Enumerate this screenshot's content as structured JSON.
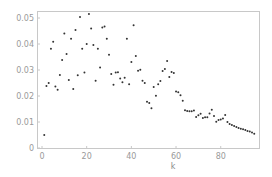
{
  "chart_data": {
    "type": "scatter",
    "title": "",
    "xlabel": "k",
    "ylabel": "",
    "xlim": [
      -2,
      98
    ],
    "ylim": [
      -0.0003,
      0.053
    ],
    "x_ticks": [
      0,
      20,
      40,
      60,
      80
    ],
    "y_ticks": [
      0,
      0.01,
      0.02,
      0.03,
      0.04,
      0.05
    ],
    "x_tick_labels": [
      "0",
      "20",
      "40",
      "60",
      "80"
    ],
    "y_tick_labels": [
      "0",
      "0.01",
      "0.02",
      "0.03",
      "0.04",
      "0.05"
    ],
    "grid": false,
    "frame": true,
    "marker_color": "#333333",
    "frame_color": "#c8c8c8",
    "series": [
      {
        "name": "data",
        "points": [
          [
            1,
            0.005
          ],
          [
            2,
            0.0238
          ],
          [
            3,
            0.025
          ],
          [
            4,
            0.0382
          ],
          [
            5,
            0.0409
          ],
          [
            6,
            0.0237
          ],
          [
            7,
            0.0224
          ],
          [
            8,
            0.0281
          ],
          [
            9,
            0.0338
          ],
          [
            10,
            0.044
          ],
          [
            11,
            0.0362
          ],
          [
            12,
            0.0262
          ],
          [
            13,
            0.042
          ],
          [
            14,
            0.0227
          ],
          [
            15,
            0.0454
          ],
          [
            16,
            0.028
          ],
          [
            17,
            0.0504
          ],
          [
            18,
            0.0382
          ],
          [
            19,
            0.029
          ],
          [
            20,
            0.04
          ],
          [
            21,
            0.0515
          ],
          [
            22,
            0.046
          ],
          [
            23,
            0.0396
          ],
          [
            24,
            0.0259
          ],
          [
            25,
            0.0382
          ],
          [
            26,
            0.031
          ],
          [
            27,
            0.0463
          ],
          [
            28,
            0.0467
          ],
          [
            29,
            0.042
          ],
          [
            30,
            0.0359
          ],
          [
            31,
            0.0285
          ],
          [
            32,
            0.0243
          ],
          [
            33,
            0.029
          ],
          [
            34,
            0.0291
          ],
          [
            35,
            0.0267
          ],
          [
            36,
            0.0253
          ],
          [
            37,
            0.027
          ],
          [
            38,
            0.042
          ],
          [
            39,
            0.0245
          ],
          [
            40,
            0.0331
          ],
          [
            41,
            0.0472
          ],
          [
            42,
            0.0354
          ],
          [
            43,
            0.0297
          ],
          [
            44,
            0.0301
          ],
          [
            45,
            0.0259
          ],
          [
            46,
            0.025
          ],
          [
            47,
            0.0178
          ],
          [
            48,
            0.0173
          ],
          [
            49,
            0.0153
          ],
          [
            50,
            0.0235
          ],
          [
            51,
            0.0201
          ],
          [
            52,
            0.0245
          ],
          [
            53,
            0.0258
          ],
          [
            54,
            0.0296
          ],
          [
            55,
            0.0304
          ],
          [
            56,
            0.0335
          ],
          [
            57,
            0.0273
          ],
          [
            58,
            0.0292
          ],
          [
            59,
            0.0288
          ],
          [
            60,
            0.0217
          ],
          [
            61,
            0.0214
          ],
          [
            62,
            0.0203
          ],
          [
            63,
            0.0182
          ],
          [
            64,
            0.0145
          ],
          [
            65,
            0.0142
          ],
          [
            66,
            0.0141
          ],
          [
            67,
            0.0141
          ],
          [
            68,
            0.0144
          ],
          [
            69,
            0.0119
          ],
          [
            70,
            0.0126
          ],
          [
            71,
            0.0132
          ],
          [
            72,
            0.0115
          ],
          [
            73,
            0.0118
          ],
          [
            74,
            0.0118
          ],
          [
            75,
            0.0133
          ],
          [
            76,
            0.0147
          ],
          [
            77,
            0.0123
          ],
          [
            78,
            0.0101
          ],
          [
            79,
            0.0108
          ],
          [
            80,
            0.011
          ],
          [
            81,
            0.0113
          ],
          [
            82,
            0.0127
          ],
          [
            83,
            0.01
          ],
          [
            84,
            0.0092
          ],
          [
            85,
            0.0088
          ],
          [
            86,
            0.0085
          ],
          [
            87,
            0.0081
          ],
          [
            88,
            0.0077
          ],
          [
            89,
            0.0074
          ],
          [
            90,
            0.0072
          ],
          [
            91,
            0.0069
          ],
          [
            92,
            0.0065
          ],
          [
            93,
            0.0063
          ],
          [
            94,
            0.006
          ],
          [
            95,
            0.0055
          ]
        ]
      }
    ]
  }
}
